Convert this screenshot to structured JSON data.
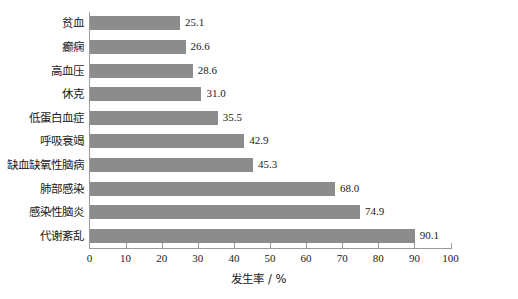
{
  "chart_data": {
    "type": "bar",
    "orientation": "horizontal",
    "title": "",
    "xlabel": "发生率 / %",
    "ylabel": "",
    "xlim": [
      0,
      100
    ],
    "xticks": [
      0,
      10,
      20,
      30,
      40,
      50,
      60,
      70,
      80,
      90,
      100
    ],
    "grid": false,
    "legend": null,
    "bar_color": "#8c8c8c",
    "axis_color": "#9a9a9a",
    "categories": [
      "贫血",
      "癫痫",
      "高血压",
      "休克",
      "低蛋白血症",
      "呼吸衰竭",
      "缺血缺氧性脑病",
      "肺部感染",
      "感染性脑炎",
      "代谢紊乱"
    ],
    "values": [
      25.1,
      26.6,
      28.6,
      31.0,
      35.5,
      42.9,
      45.3,
      68.0,
      74.9,
      90.1
    ],
    "value_labels": [
      "25.1",
      "26.6",
      "28.6",
      "31.0",
      "35.5",
      "42.9",
      "45.3",
      "68.0",
      "74.9",
      "90.1"
    ]
  }
}
